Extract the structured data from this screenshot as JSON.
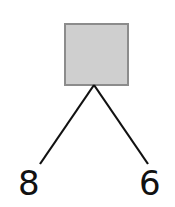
{
  "diagram": {
    "type": "number-bond",
    "whole": {
      "value": "",
      "shape": "square",
      "fill": "#cfcfcf",
      "border": "#8c8c8c"
    },
    "parts": [
      {
        "label": "8"
      },
      {
        "label": "6"
      }
    ],
    "line_color": "#111111"
  }
}
